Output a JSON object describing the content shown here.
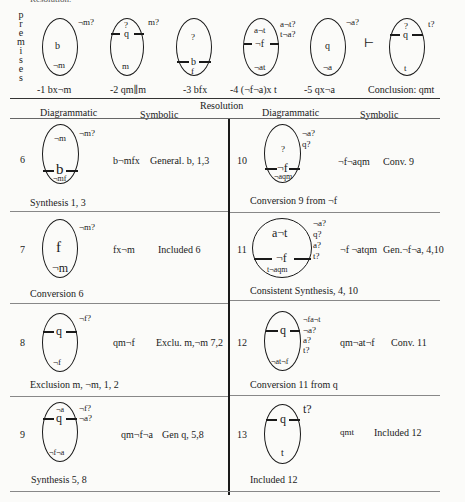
{
  "header_fragment": "Resolution.",
  "premises_label_letters": [
    "p",
    "r",
    "e",
    "m",
    "i",
    "s",
    "e",
    "s"
  ],
  "premises": [
    {
      "caption": "-1 bx¬m",
      "inside": {
        "middle": "b",
        "bottom": "¬m"
      },
      "outside": [
        "¬m?"
      ]
    },
    {
      "caption": "-2 qm∥m",
      "inside": {
        "top": "?",
        "bar": "q",
        "bottom": "m"
      },
      "outside": [
        "m?"
      ]
    },
    {
      "caption": "-3 bfx",
      "inside": {
        "top": "?",
        "bar": "b",
        "bottom": "f"
      },
      "outside": []
    },
    {
      "caption": "-4 (¬f¬a)x t",
      "inside": {
        "top": "a¬t",
        "bar": "¬f",
        "bottom": "¬at"
      },
      "outside": [
        "a¬t?",
        "t¬a?"
      ]
    },
    {
      "caption": "-5 qx¬a",
      "inside": {
        "middle": "q",
        "bottom": "¬a"
      },
      "outside": [
        "¬a?"
      ]
    }
  ],
  "entails_symbol": "⊢",
  "conclusion": {
    "caption": "Conclusion: qmt",
    "inside": {
      "top": "?",
      "bar": "q",
      "bottom": "t"
    },
    "outside": [
      "t?"
    ]
  },
  "resolution_title": "Resolution",
  "columns": {
    "left_diag": "Diagrammatic",
    "left_sym": "Symbolic",
    "right_diag": "Diagrammatic",
    "right_sym": "Symbolic"
  },
  "steps": [
    {
      "num": "6",
      "symbolic": "b¬mfx",
      "rule": "General. b, 1,3",
      "caption": "Synthesis 1, 3",
      "inside": {
        "top": "¬m",
        "bar": "b",
        "bottom": "¬mf"
      },
      "outside": [
        "¬m?"
      ]
    },
    {
      "num": "7",
      "symbolic": "fx¬m",
      "rule": "Included 6",
      "caption": "Conversion 6",
      "inside": {
        "middle": "f",
        "bottom": "¬m"
      },
      "outside": [
        "¬m?"
      ]
    },
    {
      "num": "8",
      "symbolic": "qm¬f",
      "rule": "Exclu. m,¬m 7,2",
      "caption": "Exclusion m, ¬m, 1, 2",
      "inside": {
        "bar": "q",
        "bottom": "¬f"
      },
      "outside": [
        "¬f?"
      ]
    },
    {
      "num": "9",
      "symbolic": "qm¬f¬a",
      "rule": "Gen q, 5,8",
      "caption": "Synthesis 5, 8",
      "inside": {
        "top": "¬a",
        "bar": "q",
        "bottom": "¬f¬a"
      },
      "outside": [
        "¬f?",
        "¬a?"
      ]
    },
    {
      "num": "10",
      "symbolic": "¬f¬aqm",
      "rule": "Conv. 9",
      "caption": "Conversion 9 from ¬f",
      "inside": {
        "top": "?",
        "bar": "¬f",
        "bottom": "¬aqm"
      },
      "outside": [
        "¬a?",
        "q?"
      ]
    },
    {
      "num": "11",
      "symbolic": "¬f ¬atqm",
      "rule": "Gen.¬f¬a, 4,10",
      "caption": "Consistent Synthesis, 4, 10",
      "inside": {
        "top": "a¬t",
        "bar": "¬f",
        "bottom": "t¬aqm"
      },
      "outside": [
        "¬a?",
        "q?",
        "a?",
        "t?"
      ]
    },
    {
      "num": "12",
      "symbolic": "qm¬at¬f",
      "rule": "Conv. 11",
      "caption": "Conversion 11 from q",
      "inside": {
        "bar": "q",
        "bottom": "¬at¬f"
      },
      "outside": [
        "¬fa¬t",
        "¬a?",
        "a?",
        "t?"
      ]
    },
    {
      "num": "13",
      "symbolic": "qmt",
      "rule": "Included 12",
      "caption": "Included 12",
      "inside": {
        "bar": "q",
        "bottom": "t"
      },
      "outside": [
        "t?"
      ]
    }
  ]
}
